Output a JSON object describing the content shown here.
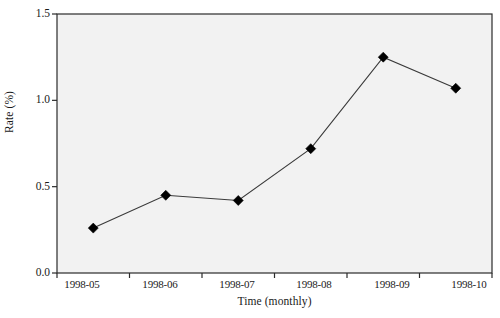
{
  "chart_data": {
    "type": "line",
    "title": "",
    "subtitle": "",
    "xlabel": "Time (monthly)",
    "ylabel": "Rate (%)",
    "categories": [
      "1998-05",
      "1998-06",
      "1998-07",
      "1998-08",
      "1998-09",
      "1998-10"
    ],
    "values": [
      0.26,
      0.45,
      0.42,
      0.72,
      1.25,
      1.07
    ],
    "series": [
      {
        "name": "Rate",
        "values": [
          0.26,
          0.45,
          0.42,
          0.72,
          1.25,
          1.07
        ]
      }
    ],
    "ylim": [
      0.0,
      1.5
    ],
    "yticks": [
      0.0,
      0.5,
      1.0,
      1.5
    ],
    "ytick_labels": [
      "0.0",
      "0.5",
      "1.0",
      "1.5"
    ],
    "xtick_labels": [
      "1998-05",
      "1998-06",
      "1998-07",
      "1998-08",
      "1998-09",
      "1998-10"
    ],
    "grid": false,
    "legend": false,
    "legend_position": "none",
    "marker": "diamond",
    "marker_color": "#000000",
    "line_color": "#3a3a3a",
    "plot_background": "#f2f2f2",
    "figure_background": "#ffffff",
    "axis_color": "#2b2b2b"
  },
  "axes": {
    "y_title": "Rate (%)",
    "x_title": "Time (monthly)"
  }
}
